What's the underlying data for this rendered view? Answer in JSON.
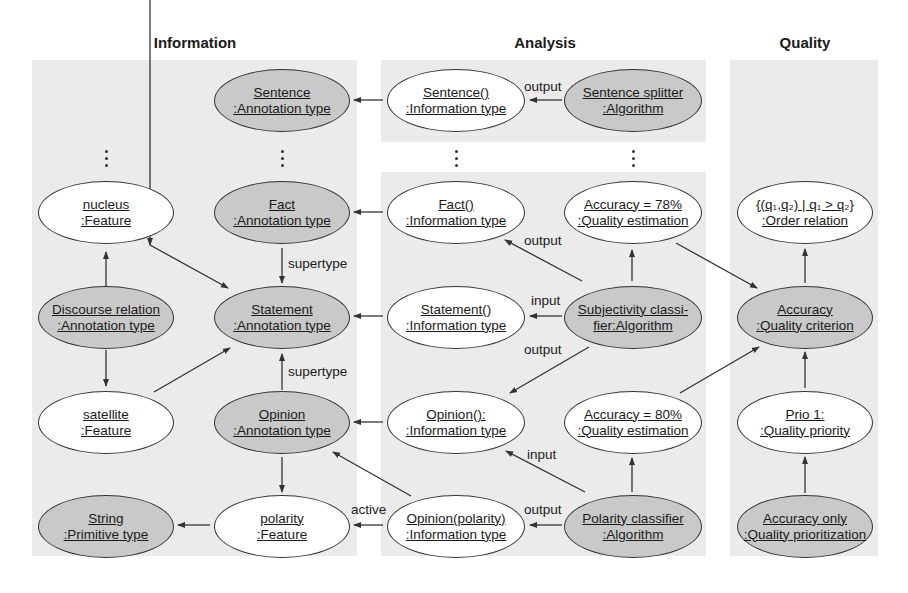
{
  "columns": {
    "information": "Information",
    "analysis": "Analysis",
    "quality": "Quality"
  },
  "nodes": {
    "sentence_annot": {
      "name": "Sentence",
      "type": ":Annotation type",
      "fill": "gray"
    },
    "nucleus": {
      "name": "nucleus",
      "type": ":Feature",
      "fill": "white"
    },
    "fact_annot": {
      "name": "Fact",
      "type": ":Annotation type",
      "fill": "gray"
    },
    "discourse": {
      "name": "Discourse relation",
      "type": ":Annotation type",
      "fill": "gray"
    },
    "statement_annot": {
      "name": "Statement",
      "type": ":Annotation type",
      "fill": "gray"
    },
    "satellite": {
      "name": "satellite",
      "type": ":Feature",
      "fill": "white"
    },
    "opinion_annot": {
      "name": "Opinion",
      "type": ":Annotation type",
      "fill": "gray"
    },
    "string": {
      "name": "String",
      "type": ":Primitive type",
      "fill": "gray"
    },
    "polarity_feat": {
      "name": "polarity",
      "type": ":Feature",
      "fill": "white"
    },
    "sentence_info": {
      "name": "Sentence()",
      "type": ":Information type",
      "fill": "white"
    },
    "sentence_splitter": {
      "name": "Sentence splitter",
      "type": ":Algorithm",
      "fill": "gray"
    },
    "fact_info": {
      "name": "Fact()",
      "type": ":Information type",
      "fill": "white"
    },
    "acc78": {
      "name": "Accuracy = 78%",
      "type": ":Quality estimation",
      "fill": "white"
    },
    "statement_info": {
      "name": "Statement()",
      "type": ":Information type",
      "fill": "white"
    },
    "subjectivity": {
      "name": "Subjectivity classi-",
      "type": "fier:Algorithm",
      "fill": "gray"
    },
    "opinion_info": {
      "name": "Opinion():",
      "type": ":Information type",
      "fill": "white"
    },
    "acc80": {
      "name": "Accuracy = 80%",
      "type": ":Quality estimation",
      "fill": "white"
    },
    "opinion_polarity_info": {
      "name": "Opinion(polarity)",
      "type": ":Information type",
      "fill": "white"
    },
    "polarity_classifier": {
      "name": "Polarity classifier",
      "type": ":Algorithm",
      "fill": "gray"
    },
    "order_relation": {
      "name": "{(q₁,q₂) | q₁ > q₂}",
      "type": ":Order relation",
      "fill": "white"
    },
    "accuracy_criterion": {
      "name": "Accuracy",
      "type": ":Quality criterion",
      "fill": "gray"
    },
    "prio1": {
      "name": "Prio 1:",
      "type": ":Quality priority",
      "fill": "white"
    },
    "accuracy_only": {
      "name": "Accuracy only",
      "type": ":Quality prioritization",
      "fill": "gray"
    }
  },
  "edge_labels": {
    "splitter_output": "output",
    "supertype_fact": "supertype",
    "supertype_opinion": "supertype",
    "subj_output_fact": "output",
    "subj_input": "input",
    "subj_output_opinion": "output",
    "polarity_input": "input",
    "polarity_output": "output",
    "active": "active"
  },
  "colors": {
    "panel": "#ebebeb",
    "node_gray": "#c9c9c9",
    "node_white": "#ffffff",
    "stroke": "#333333"
  }
}
